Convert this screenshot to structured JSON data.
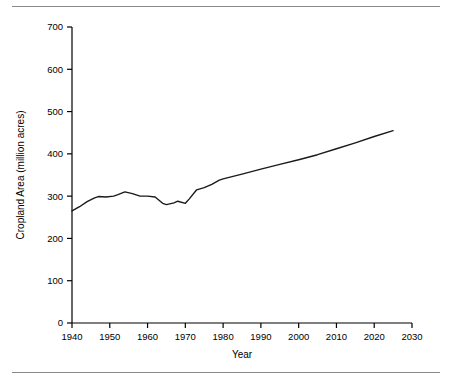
{
  "chart_data": {
    "type": "line",
    "title": "",
    "xlabel": "Year",
    "ylabel": "Cropland Area (million acres)",
    "xlim": [
      1940,
      2030
    ],
    "ylim": [
      0,
      700
    ],
    "xticks": [
      1940,
      1950,
      1960,
      1970,
      1980,
      1990,
      2000,
      2010,
      2020,
      2030
    ],
    "yticks": [
      0,
      100,
      200,
      300,
      400,
      500,
      600,
      700
    ],
    "grid": false,
    "legend": null,
    "line_color": "#1a1a1a",
    "series": [
      {
        "name": "Cropland Area",
        "x": [
          1940,
          1942,
          1944,
          1946,
          1947,
          1949,
          1951,
          1952,
          1954,
          1956,
          1958,
          1960,
          1962,
          1964,
          1965,
          1967,
          1968,
          1970,
          1971,
          1973,
          1975,
          1977,
          1979,
          1980,
          1985,
          1990,
          1995,
          2000,
          2005,
          2010,
          2015,
          2020,
          2025
        ],
        "values": [
          265,
          275,
          287,
          296,
          299,
          298,
          300,
          303,
          310,
          306,
          300,
          300,
          298,
          283,
          280,
          284,
          288,
          283,
          293,
          315,
          320,
          328,
          338,
          341,
          352,
          364,
          375,
          386,
          398,
          412,
          426,
          441,
          455
        ]
      }
    ]
  },
  "axes": {
    "x_tick_labels": [
      "1940",
      "1950",
      "1960",
      "1970",
      "1980",
      "1990",
      "2000",
      "2010",
      "2020",
      "2030"
    ],
    "y_tick_labels": [
      "0",
      "100",
      "200",
      "300",
      "400",
      "500",
      "600",
      "700"
    ],
    "x_axis_title": "Year",
    "y_axis_title": "Cropland Area (million acres)"
  }
}
